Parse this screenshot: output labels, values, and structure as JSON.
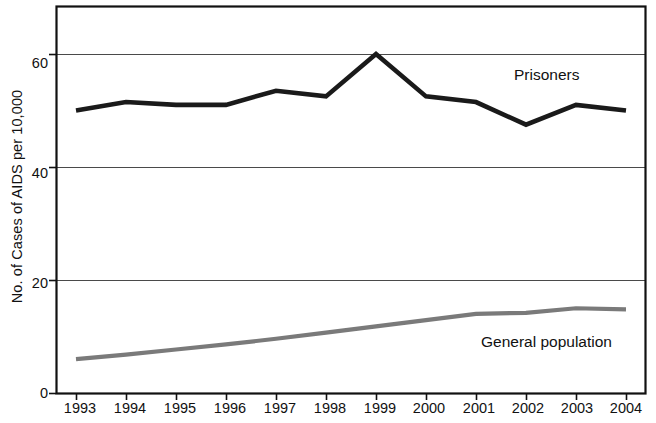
{
  "chart_data": {
    "type": "line",
    "title": "",
    "subtitle": "",
    "xlabel": "",
    "ylabel": "No. of Cases of AIDS per 10,000",
    "x": [
      1993,
      1994,
      1995,
      1996,
      1997,
      1998,
      1999,
      2000,
      2001,
      2002,
      2003,
      2004
    ],
    "categories": [
      "1993",
      "1994",
      "1995",
      "1996",
      "1997",
      "1998",
      "1999",
      "2000",
      "2001",
      "2002",
      "2003",
      "2004"
    ],
    "series": [
      {
        "name": "Prisoners",
        "color": "#1a1a1a",
        "values": [
          50,
          51.5,
          51,
          51,
          53.5,
          52.5,
          60,
          52.5,
          51.5,
          47.5,
          51,
          50
        ]
      },
      {
        "name": "General population",
        "color": "#7a7a7a",
        "values": [
          6,
          6.8,
          7.7,
          8.6,
          9.6,
          10.7,
          11.8,
          12.9,
          14,
          14.2,
          15,
          14.8
        ]
      }
    ],
    "xlim": [
      1992.6,
      2004.4
    ],
    "ylim": [
      0,
      68.5
    ],
    "yticks": [
      0,
      20,
      40,
      60
    ],
    "ytick_labels": [
      "0",
      "20",
      "40",
      "60"
    ],
    "grid": "horizontal",
    "grid_color": "#4a4a4a",
    "frame": true,
    "frame_color": "#111111",
    "legend": "inline-annotations",
    "annotations": [
      {
        "text": "Prisoners",
        "series": "Prisoners"
      },
      {
        "text": "General population",
        "series": "General population"
      }
    ]
  },
  "axes": {
    "y_title": "No. of Cases of AIDS per 10,000",
    "y_ticks": [
      "60",
      "40",
      "20",
      "0"
    ],
    "x_ticks": [
      "1993",
      "1994",
      "1995",
      "1996",
      "1997",
      "1998",
      "1999",
      "2000",
      "2001",
      "2002",
      "2003",
      "2004"
    ]
  },
  "labels": {
    "prisoners": "Prisoners",
    "general_population": "General population"
  }
}
